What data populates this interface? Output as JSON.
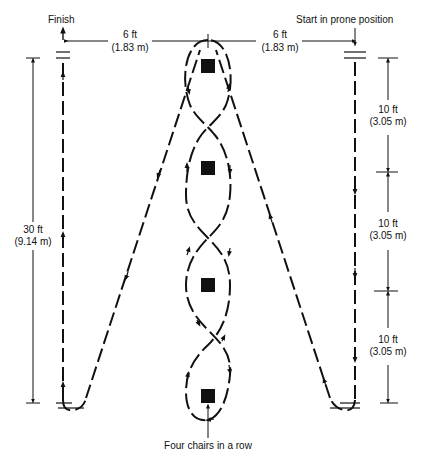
{
  "diagram": {
    "title_labels": {
      "finish": "Finish",
      "start": "Start in prone position",
      "chairs": "Four chairs in a row"
    },
    "dimensions": {
      "left_horizontal": {
        "ft": "6 ft",
        "m": "(1.83 m)"
      },
      "right_horizontal": {
        "ft": "6 ft",
        "m": "(1.83 m)"
      },
      "total_length": {
        "ft": "30 ft",
        "m": "(9.14 m)"
      },
      "segments": [
        {
          "ft": "10 ft",
          "m": "(3.05 m)"
        },
        {
          "ft": "10 ft",
          "m": "(3.05 m)"
        },
        {
          "ft": "10 ft",
          "m": "(3.05 m)"
        }
      ]
    },
    "chairs_count": 4,
    "colors": {
      "ink": "#111111",
      "background": "#ffffff"
    }
  }
}
